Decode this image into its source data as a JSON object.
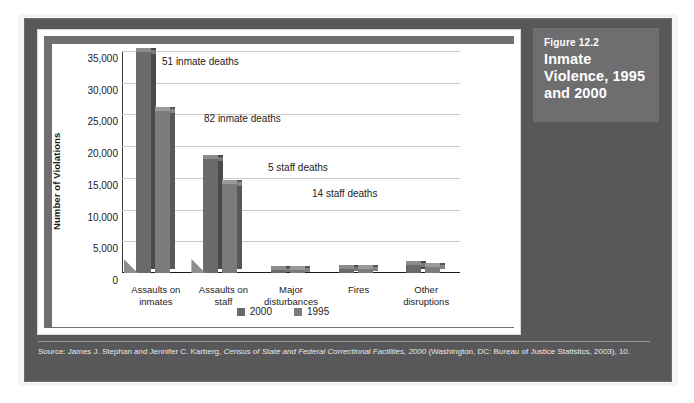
{
  "figure": {
    "number_label": "Figure 12.2",
    "title": "Inmate Violence, 1995 and 2000"
  },
  "source": {
    "prefix": "Source: James J. Stephan and Jennifer C. Karberg, ",
    "italic_title": "Census of State and Federal Correctional Facilities, 2000",
    "suffix": " (Washington, DC: Bureau of Justice Statistics, 2003), 10."
  },
  "legend": {
    "items": [
      {
        "label": "2000",
        "color": "#6a6a6c"
      },
      {
        "label": "1995",
        "color": "#7b7b7d"
      }
    ]
  },
  "axes": {
    "y_title": "Number of Violations",
    "y_ticks": [
      "0",
      "5,000",
      "10,000",
      "15,000",
      "20,000",
      "25,000",
      "30,000",
      "35,000"
    ]
  },
  "annotations": [
    {
      "text": "51 inmate deaths"
    },
    {
      "text": "82 inmate deaths"
    },
    {
      "text": "5 staff deaths"
    },
    {
      "text": "14 staff deaths"
    }
  ],
  "chart_data": {
    "type": "bar",
    "title": "Inmate Violence, 1995 and 2000",
    "xlabel": "",
    "ylabel": "Number of Violations",
    "ylim": [
      0,
      35000
    ],
    "ytick_step": 5000,
    "grid": true,
    "legend_position": "bottom-center",
    "categories": [
      "Assaults on inmates",
      "Assaults on staff",
      "Major disturbances",
      "Fires",
      "Other disruptions"
    ],
    "category_lines": [
      [
        "Assaults on",
        "inmates"
      ],
      [
        "Assaults on",
        "staff"
      ],
      [
        "Major",
        "disturbances"
      ],
      [
        "Fires",
        ""
      ],
      [
        "Other",
        "disruptions"
      ]
    ],
    "series": [
      {
        "name": "2000",
        "color": "#6a6a6c",
        "values": [
          34900,
          18000,
          300,
          700,
          1200
        ]
      },
      {
        "name": "1995",
        "color": "#7b7b7d",
        "values": [
          25500,
          14000,
          200,
          600,
          1000
        ]
      }
    ],
    "annotations": [
      {
        "text": "51 inmate deaths",
        "series": "2000",
        "category": "Assaults on inmates"
      },
      {
        "text": "82 inmate deaths",
        "series": "1995",
        "category": "Assaults on inmates"
      },
      {
        "text": "5 staff deaths",
        "series": "2000",
        "category": "Assaults on staff"
      },
      {
        "text": "14 staff deaths",
        "series": "1995",
        "category": "Assaults on staff"
      }
    ]
  }
}
